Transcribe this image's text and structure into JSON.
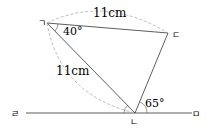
{
  "points": {
    "A": {
      "label": "ㄱ",
      "x": 47,
      "y": 23
    },
    "B": {
      "label": "ㄴ",
      "x": 135,
      "y": 113
    },
    "C": {
      "label": "ㄷ",
      "x": 168,
      "y": 33
    },
    "D": {
      "label": "ㄹ",
      "x": 18,
      "y": 113
    },
    "E": {
      "label": "ㅁ",
      "x": 198,
      "y": 113
    }
  },
  "measurements": {
    "side_AC": "11cm",
    "side_AB": "11cm",
    "angle_A": "40°",
    "angle_B": "65°"
  },
  "colors": {
    "line": "#333333",
    "dashed": "#aaaaaa"
  }
}
